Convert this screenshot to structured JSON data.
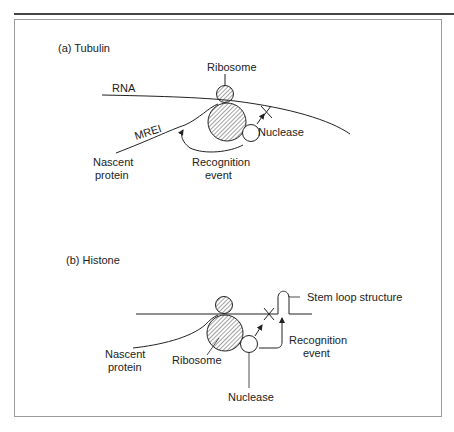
{
  "figure": {
    "panel_a": {
      "title": "(a) Tubulin",
      "labels": {
        "ribosome": "Ribosome",
        "rna": "RNA",
        "mrei": "MREI",
        "nuclease": "Nuclease",
        "nascent_line1": "Nascent",
        "nascent_line2": "protein",
        "recognition_line1": "Recognition",
        "recognition_line2": "event"
      }
    },
    "panel_b": {
      "title": "(b) Histone",
      "labels": {
        "stem_loop": "Stem loop structure",
        "nascent_line1": "Nascent",
        "nascent_line2": "protein",
        "ribosome": "Ribosome",
        "recognition_line1": "Recognition",
        "recognition_line2": "event",
        "nuclease": "Nuclease"
      }
    },
    "colors": {
      "line": "#222222",
      "frame": "#9a9a9a",
      "rule": "#444444"
    }
  }
}
